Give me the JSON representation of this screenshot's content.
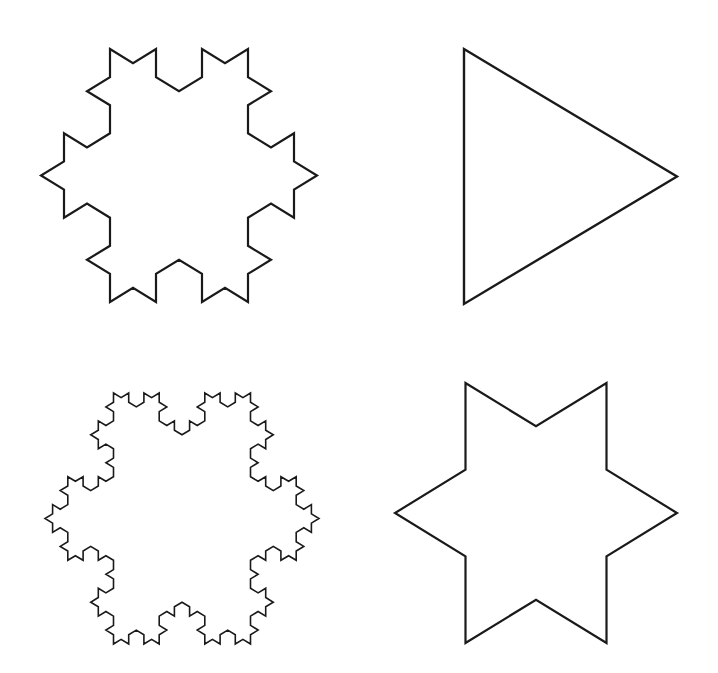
{
  "diagram": {
    "title": "",
    "stroke_color": "#1a1a1a",
    "background": "#ffffff",
    "shapes": [
      {
        "id": "koch-order-0",
        "label": "Triangle",
        "order": 0,
        "bbox": [
          464,
          49,
          677,
          304
        ],
        "stroke_width": 2.4
      },
      {
        "id": "koch-order-1",
        "label": "Six-pointed star",
        "order": 1,
        "bbox": [
          395,
          383,
          677,
          643
        ],
        "stroke_width": 2.2
      },
      {
        "id": "koch-order-2",
        "label": "Koch snowflake order 2",
        "order": 2,
        "bbox": [
          41,
          49,
          317,
          302
        ],
        "stroke_width": 2.2
      },
      {
        "id": "koch-order-3",
        "label": "Koch snowflake order 3",
        "order": 3,
        "bbox": [
          45,
          393,
          319,
          644
        ],
        "stroke_width": 1.6
      }
    ]
  }
}
